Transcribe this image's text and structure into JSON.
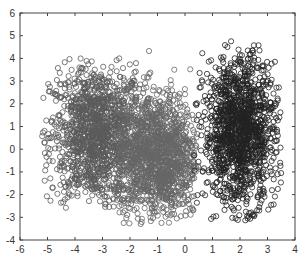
{
  "chart_data": {
    "type": "scatter",
    "title": "",
    "xlabel": "",
    "ylabel": "",
    "xlim": [
      -6,
      4
    ],
    "ylim": [
      -4,
      6
    ],
    "xticks": [
      -6,
      -5,
      -4,
      -3,
      -2,
      -1,
      0,
      1,
      2,
      3,
      4
    ],
    "yticks": [
      -4,
      -3,
      -2,
      -1,
      0,
      1,
      2,
      3,
      4,
      5,
      6
    ],
    "grid": false,
    "legend": null,
    "marker": "open-circle",
    "series": [
      {
        "name": "cluster-left",
        "color": "#5a5a5a",
        "center": [
          -3.2,
          0.6
        ],
        "spread": [
          0.85,
          1.55
        ],
        "approx_count": 2500,
        "x_extent": [
          -5.2,
          -1.5
        ],
        "y_extent": [
          -2.6,
          4.0
        ]
      },
      {
        "name": "cluster-middle",
        "color": "#666666",
        "center": [
          -1.0,
          -0.3
        ],
        "spread": [
          0.75,
          1.4
        ],
        "approx_count": 2500,
        "x_extent": [
          -2.5,
          0.5
        ],
        "y_extent": [
          -3.3,
          4.6
        ]
      },
      {
        "name": "cluster-right",
        "color": "#222222",
        "center": [
          2.0,
          0.8
        ],
        "spread": [
          0.65,
          1.6
        ],
        "approx_count": 2500,
        "x_extent": [
          0.3,
          3.5
        ],
        "y_extent": [
          -3.2,
          4.8
        ]
      }
    ]
  }
}
